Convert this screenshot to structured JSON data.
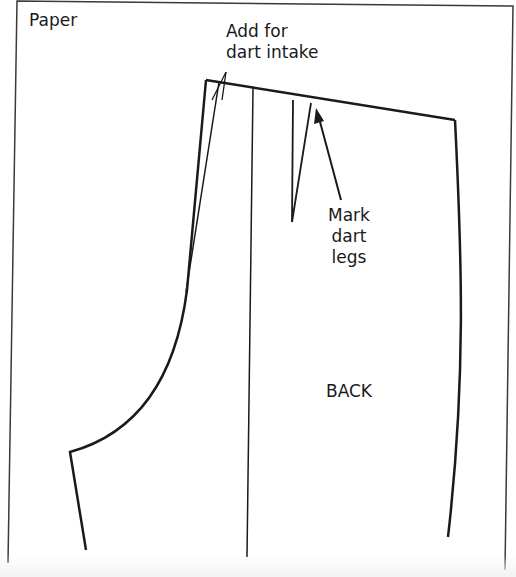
{
  "labels": {
    "paper": "Paper",
    "add_for_dart_intake": "Add for\ndart intake",
    "mark_dart_legs": "Mark\ndart\nlegs",
    "back": "BACK"
  },
  "colors": {
    "background": "#ffffff",
    "line": "#1a1a1a",
    "paper_border": "#3a3a3a"
  },
  "diagram": {
    "type": "sewing-pattern",
    "piece": "trouser back",
    "paper_border": [
      [
        17,
        1
      ],
      [
        513,
        6
      ],
      [
        505,
        570
      ],
      [
        8,
        563
      ]
    ],
    "waistline": [
      [
        206,
        80
      ],
      [
        455,
        120
      ]
    ],
    "grainline": [
      [
        253,
        88
      ],
      [
        247,
        557
      ]
    ],
    "dart": {
      "leg1_top": [
        293,
        100
      ],
      "leg2_top": [
        311,
        103
      ],
      "point": [
        292,
        222
      ]
    },
    "dart_intake_lines": [
      [
        [
          206,
          80
        ],
        [
          186,
          290
        ]
      ],
      [
        [
          219,
          82
        ],
        [
          186,
          290
        ]
      ]
    ],
    "annotation_arrows": [
      {
        "from": [
          340,
          200
        ],
        "to": [
          316,
          112
        ]
      }
    ]
  }
}
